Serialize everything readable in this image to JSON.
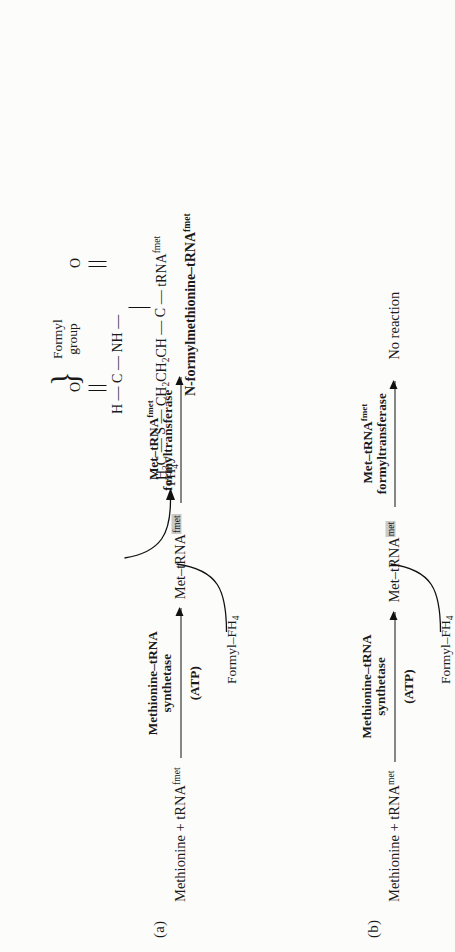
{
  "figure": {
    "panels": [
      {
        "id": "a",
        "label": "(a)",
        "substrate": "Methionine + tRNA",
        "substrate_sup": "fmet",
        "step1_enzyme_line1": "Methionine–tRNA",
        "step1_enzyme_line2": "synthetase",
        "step1_cofactor": "(ATP)",
        "intermediate": "Met–tRNA",
        "intermediate_sup": "fmet",
        "intermediate_highlighted": true,
        "step2_enzyme_line1": "Met–tRNA",
        "step2_enzyme_line1_sup": "fmet",
        "step2_enzyme_line2": "formyltransferase",
        "step2_reagent_in": "Formyl–FH",
        "step2_reagent_in_sub": "4",
        "step2_byproduct": "FH",
        "step2_byproduct_sub": "4",
        "product_type": "structure",
        "product_name": "N-formylmethionine–tRNA",
        "product_name_sup": "fmet"
      },
      {
        "id": "b",
        "label": "(b)",
        "substrate": "Methionine + tRNA",
        "substrate_sup": "met",
        "step1_enzyme_line1": "Methionine–tRNA",
        "step1_enzyme_line2": "synthetase",
        "step1_cofactor": "(ATP)",
        "intermediate": "Met–tRNA",
        "intermediate_sup": "met",
        "intermediate_highlighted": true,
        "step2_enzyme_line1": "Met–tRNA",
        "step2_enzyme_line1_sup": "fmet",
        "step2_enzyme_line2": "formyltransferase",
        "step2_reagent_in": "Formyl–FH",
        "step2_reagent_in_sub": "4",
        "step2_byproduct": "",
        "product_type": "text",
        "product_text": "No reaction"
      }
    ],
    "structure": {
      "formyl_brace_label_line1": "Formyl",
      "formyl_brace_label_line2": "group",
      "atom_O_top": "O",
      "atom_C_formyl": "C",
      "atom_H": "H",
      "atom_NH": "NH",
      "atom_O_carbonyl": "O",
      "atom_C_carbonyl": "C",
      "backbone": "H₃C — S — CH₂CH₂CH — C — tRNA",
      "backbone_h3c": "H",
      "backbone_h3c_sub": "3",
      "backbone_h3c_rest": "C",
      "backbone_s": "S",
      "backbone_chain": "CH",
      "backbone_chain_sub1": "2",
      "backbone_chain_mid": "CH",
      "backbone_chain_sub2": "2",
      "backbone_chain_end": "CH",
      "backbone_c": "C",
      "backbone_trna": "tRNA",
      "backbone_trna_sup": "fmet",
      "dash": "—"
    },
    "colors": {
      "ink": "#111111",
      "highlight": "#c9c9c9",
      "background": "#fcfcfb"
    }
  }
}
